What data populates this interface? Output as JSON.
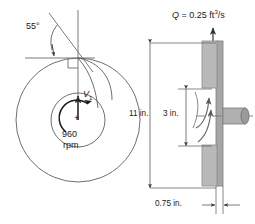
{
  "figure": {
    "name": "centrifugal-pump-impeller-diagram",
    "views": [
      "front-view",
      "side-section-view"
    ]
  },
  "front_view": {
    "angle_label": "55°",
    "velocity_label": "V",
    "velocity_subscript": "1",
    "speed_value": "960",
    "speed_unit": "rpm",
    "center_mark": "+",
    "rotation_direction": "counterclockwise",
    "outer_circle": {
      "cx": 78,
      "cy": 120,
      "r": 62
    },
    "inner_circle": {
      "cx": 78,
      "cy": 120,
      "r": 27
    },
    "right_angle_marker": true
  },
  "side_view": {
    "flow_symbol": "Q",
    "flow_equals": "=",
    "flow_value": "0.25",
    "flow_unit_base": "ft",
    "flow_unit_exponent": "3",
    "flow_unit_denom": "/s",
    "dimension_outer": "11 in.",
    "dimension_inner": "3 in.",
    "dimension_width": "0.75 in.",
    "shaft_centerline": true
  },
  "colors": {
    "line": "#3a3a3a",
    "thin_line": "#6b6b6b",
    "casing_fill": "#b9b9b9",
    "casing_stroke": "#8a8a8a",
    "plate_fill": "#a6a6a6",
    "shaft_fill": "#b0b0b0",
    "text": "#1b1b1b",
    "background": "#ffffff"
  }
}
